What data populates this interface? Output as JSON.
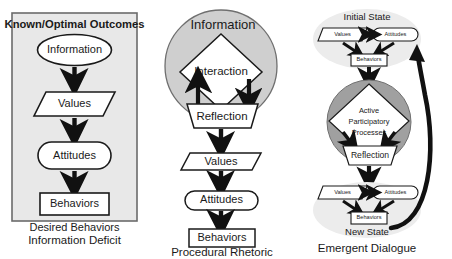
{
  "figure": {
    "background": "#ffffff",
    "colors": {
      "box_fill": "#e8e8e8",
      "box_stroke": "#6b6b6b",
      "light_circle_fill": "#cfcfcf",
      "light_ellipse_fill": "#ececec",
      "dark_circle_fill": "#a0a0a0",
      "shape_fill": "#ffffff",
      "shape_stroke": "#1a1a1a",
      "arrow": "#111111",
      "text": "#1a1a1a"
    }
  },
  "panels": [
    {
      "id": "information-deficit",
      "caption": "Information Deficit",
      "header": "Known/Optimal Outcomes",
      "footer": "Desired Behaviors",
      "nodes": [
        {
          "id": "information",
          "label": "Information",
          "shape": "ellipse"
        },
        {
          "id": "values",
          "label": "Values",
          "shape": "parallelogram"
        },
        {
          "id": "attitudes",
          "label": "Attitudes",
          "shape": "stadium"
        },
        {
          "id": "behaviors",
          "label": "Behaviors",
          "shape": "rectangle"
        }
      ],
      "edges": [
        {
          "from": "information",
          "to": "values",
          "type": "arrow-down"
        },
        {
          "from": "values",
          "to": "attitudes",
          "type": "arrow-down"
        },
        {
          "from": "attitudes",
          "to": "behaviors",
          "type": "arrow-down"
        }
      ]
    },
    {
      "id": "procedural-rhetoric",
      "caption": "Procedural Rhetoric",
      "circle_label": "Information",
      "nodes": [
        {
          "id": "interaction",
          "label": "Interaction",
          "shape": "diamond"
        },
        {
          "id": "reflection",
          "label": "Reflection",
          "shape": "trapezoid"
        },
        {
          "id": "values",
          "label": "Values",
          "shape": "parallelogram"
        },
        {
          "id": "attitudes",
          "label": "Attitudes",
          "shape": "stadium"
        },
        {
          "id": "behaviors",
          "label": "Behaviors",
          "shape": "rectangle"
        }
      ],
      "edges": [
        {
          "from": "interaction",
          "to": "reflection",
          "type": "arrow-down-right"
        },
        {
          "from": "reflection",
          "to": "interaction",
          "type": "arrow-up-left"
        },
        {
          "from": "reflection",
          "to": "values",
          "type": "arrow-down"
        },
        {
          "from": "values",
          "to": "attitudes",
          "type": "arrow-down"
        },
        {
          "from": "attitudes",
          "to": "behaviors",
          "type": "arrow-down"
        }
      ]
    },
    {
      "id": "emergent-dialogue",
      "caption": "Emergent Dialogue",
      "initial_state_label": "Initial State",
      "new_state_label": "New State",
      "initial_state_nodes": [
        {
          "id": "values",
          "label": "Values",
          "shape": "parallelogram"
        },
        {
          "id": "attitudes",
          "label": "Attitudes",
          "shape": "stadium"
        },
        {
          "id": "behaviors",
          "label": "Behaviors",
          "shape": "rectangle"
        }
      ],
      "new_state_nodes": [
        {
          "id": "values",
          "label": "Values",
          "shape": "parallelogram"
        },
        {
          "id": "attitudes",
          "label": "Attitudes",
          "shape": "stadium"
        },
        {
          "id": "behaviors",
          "label": "Behaviors",
          "shape": "rectangle"
        }
      ],
      "process_nodes": [
        {
          "id": "active-participatory-processes",
          "label_line_1": "Active",
          "label_line_2": "Participatory",
          "label_line_3": "Processes",
          "shape": "diamond"
        },
        {
          "id": "reflection",
          "label": "Reflection",
          "shape": "trapezoid"
        }
      ],
      "edges": [
        {
          "from": "values",
          "to": "attitudes",
          "type": "double-arrow"
        },
        {
          "from": "values",
          "to": "behaviors",
          "type": "arrow"
        },
        {
          "from": "attitudes",
          "to": "behaviors",
          "type": "arrow"
        },
        {
          "from": "initial-behaviors",
          "to": "active-participatory-processes",
          "type": "arrow-down"
        },
        {
          "from": "active-participatory-processes",
          "to": "reflection",
          "type": "arrow-down"
        },
        {
          "from": "reflection",
          "to": "new-state",
          "type": "arrow-down"
        },
        {
          "from": "new-state",
          "to": "initial-state",
          "type": "curved-feedback-arrow"
        }
      ]
    }
  ]
}
